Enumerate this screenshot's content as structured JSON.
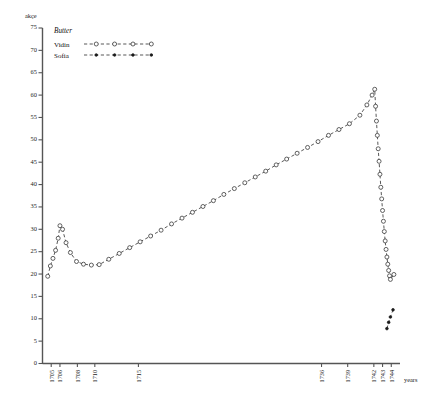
{
  "chart_data": {
    "type": "line",
    "title": "Butter",
    "xlabel": "years",
    "ylabel": "akçe",
    "ylim": [
      0,
      75
    ],
    "y_ticks": [
      0,
      5,
      10,
      15,
      20,
      25,
      30,
      35,
      40,
      45,
      50,
      55,
      60,
      65,
      70,
      75
    ],
    "x_tick_labels": [
      "1705",
      "1706",
      "1708",
      "1710",
      "1715",
      "1736",
      "1739",
      "1742",
      "1743",
      "1744"
    ],
    "x_tick_years": [
      1705,
      1706,
      1708,
      1710,
      1715,
      1736,
      1739,
      1742,
      1743,
      1744
    ],
    "xlim": [
      1704,
      1745
    ],
    "grid": false,
    "legend_position": "top-left",
    "series": [
      {
        "name": "Vidin",
        "marker": "open-circle",
        "linestyle": "dashed",
        "points": [
          [
            1704.6,
            19.5
          ],
          [
            1704.9,
            21.8
          ],
          [
            1705.2,
            23.5
          ],
          [
            1705.5,
            25.3
          ],
          [
            1705.8,
            28.0
          ],
          [
            1706.0,
            30.8
          ],
          [
            1706.3,
            30.0
          ],
          [
            1706.7,
            27.0
          ],
          [
            1707.2,
            24.8
          ],
          [
            1707.9,
            22.8
          ],
          [
            1708.7,
            22.2
          ],
          [
            1709.6,
            22.0
          ],
          [
            1710.5,
            22.1
          ],
          [
            1711.6,
            23.3
          ],
          [
            1712.8,
            24.6
          ],
          [
            1714.0,
            25.9
          ],
          [
            1715.2,
            27.2
          ],
          [
            1716.4,
            28.5
          ],
          [
            1717.6,
            29.8
          ],
          [
            1718.8,
            31.2
          ],
          [
            1720.0,
            32.5
          ],
          [
            1721.2,
            33.8
          ],
          [
            1722.4,
            35.1
          ],
          [
            1723.6,
            36.4
          ],
          [
            1724.8,
            37.8
          ],
          [
            1726.0,
            39.1
          ],
          [
            1727.2,
            40.4
          ],
          [
            1728.4,
            41.7
          ],
          [
            1729.6,
            43.0
          ],
          [
            1730.8,
            44.4
          ],
          [
            1732.0,
            45.7
          ],
          [
            1733.2,
            47.0
          ],
          [
            1734.4,
            48.3
          ],
          [
            1735.6,
            49.6
          ],
          [
            1736.8,
            51.0
          ],
          [
            1738.0,
            52.3
          ],
          [
            1739.2,
            53.6
          ],
          [
            1740.4,
            55.5
          ],
          [
            1741.2,
            57.8
          ],
          [
            1741.8,
            60.0
          ],
          [
            1742.1,
            61.3
          ],
          [
            1742.2,
            57.5
          ],
          [
            1742.3,
            54.2
          ],
          [
            1742.4,
            51.0
          ],
          [
            1742.5,
            48.0
          ],
          [
            1742.6,
            45.2
          ],
          [
            1742.7,
            42.3
          ],
          [
            1742.8,
            39.4
          ],
          [
            1742.9,
            36.8
          ],
          [
            1743.0,
            34.2
          ],
          [
            1743.1,
            31.8
          ],
          [
            1743.2,
            29.5
          ],
          [
            1743.3,
            27.4
          ],
          [
            1743.4,
            25.5
          ],
          [
            1743.5,
            23.8
          ],
          [
            1743.6,
            22.2
          ],
          [
            1743.7,
            20.8
          ],
          [
            1743.8,
            19.6
          ],
          [
            1743.9,
            18.8
          ],
          [
            1744.3,
            19.9
          ]
        ]
      },
      {
        "name": "Sofia",
        "marker": "filled-dot",
        "linestyle": "dashed",
        "points": [
          [
            1743.5,
            7.8
          ],
          [
            1743.7,
            9.2
          ],
          [
            1743.9,
            10.4
          ],
          [
            1744.2,
            12.0
          ]
        ]
      }
    ]
  },
  "legend": {
    "title": "Butter",
    "entries": [
      {
        "label": "Vidin",
        "marker": "open-circle"
      },
      {
        "label": "Sofia",
        "marker": "filled-dot"
      }
    ]
  },
  "axes": {
    "y_axis_name": "akçe",
    "x_axis_name": "years"
  }
}
